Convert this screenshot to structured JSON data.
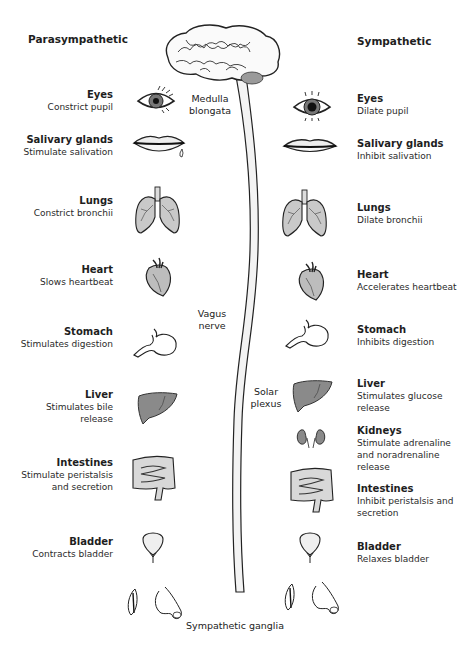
{
  "headers": {
    "left": "Parasympathetic",
    "right": "Sympathetic"
  },
  "central_labels": {
    "medulla": "Medulla",
    "medulla2": "blongata",
    "vagus": "Vagus",
    "vagus2": "nerve",
    "solar": "Solar",
    "solar2": "plexus",
    "ganglia": "Sympathetic ganglia"
  },
  "parasympathetic": [
    {
      "organ": "Eyes",
      "effect": [
        "Constrict pupil"
      ],
      "icon": "eye-icon"
    },
    {
      "organ": "Salivary glands",
      "effect": [
        "Stimulate salivation"
      ],
      "icon": "lips-icon"
    },
    {
      "organ": "Lungs",
      "effect": [
        "Constrict bronchii"
      ],
      "icon": "lungs-icon"
    },
    {
      "organ": "Heart",
      "effect": [
        "Slows heartbeat"
      ],
      "icon": "heart-icon"
    },
    {
      "organ": "Stomach",
      "effect": [
        "Stimulates digestion"
      ],
      "icon": "stomach-icon"
    },
    {
      "organ": "Liver",
      "effect": [
        "Stimulates bile",
        "release"
      ],
      "icon": "liver-icon"
    },
    {
      "organ": "Intestines",
      "effect": [
        "Stimulate peristalsis",
        "and secretion"
      ],
      "icon": "intestines-icon"
    },
    {
      "organ": "Bladder",
      "effect": [
        "Contracts bladder"
      ],
      "icon": "bladder-icon"
    }
  ],
  "sympathetic": [
    {
      "organ": "Eyes",
      "effect": [
        "Dilate pupil"
      ],
      "icon": "eye-icon"
    },
    {
      "organ": "Salivary glands",
      "effect": [
        "Inhibit salivation"
      ],
      "icon": "lips-icon"
    },
    {
      "organ": "Lungs",
      "effect": [
        "Dilate bronchii"
      ],
      "icon": "lungs-icon"
    },
    {
      "organ": "Heart",
      "effect": [
        "Accelerates heartbeat"
      ],
      "icon": "heart-icon"
    },
    {
      "organ": "Stomach",
      "effect": [
        "Inhibits digestion"
      ],
      "icon": "stomach-icon"
    },
    {
      "organ": "Liver",
      "effect": [
        "Stimulates glucose",
        "release"
      ],
      "icon": "liver-icon"
    },
    {
      "organ": "Kidneys",
      "effect": [
        "Stimulate adrenaline",
        "and noradrenaline",
        "release"
      ],
      "icon": "kidneys-icon"
    },
    {
      "organ": "Intestines",
      "effect": [
        "Inhibit peristalsis and",
        "secretion"
      ],
      "icon": "intestines-icon"
    },
    {
      "organ": "Bladder",
      "effect": [
        "Relaxes bladder"
      ],
      "icon": "bladder-icon"
    }
  ],
  "colors": {
    "organ_fill": "#8a8a8a",
    "lung_fill": "#c9c9c9",
    "outline": "#222222"
  }
}
